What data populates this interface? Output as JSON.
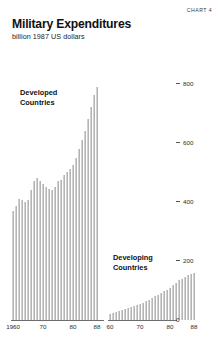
{
  "header": {
    "chart_label": "CHART 4",
    "title": "Military Expenditures",
    "subtitle": "billion 1987 US dollars"
  },
  "colors": {
    "bar": "#b4b4b4",
    "axis": "#6d6d6d",
    "text": "#111111"
  },
  "chart_data": {
    "type": "bar",
    "title": "Military Expenditures",
    "subtitle": "billion 1987 US dollars",
    "xlabel": "",
    "ylabel": "billion 1987 US dollars",
    "ylim": [
      0,
      880
    ],
    "grid": false,
    "legend_position": "inline-annotation",
    "y_ticks": [
      {
        "value": 800,
        "label": "800"
      },
      {
        "value": 600,
        "label": "600"
      },
      {
        "value": 400,
        "label": "400"
      },
      {
        "value": 200,
        "label": "200"
      },
      {
        "value": 0,
        "label": "0"
      }
    ],
    "panels": [
      {
        "name": "Developed Countries",
        "annotation_lines": [
          "Developed",
          "Countries"
        ],
        "x_tick_labels": [
          "1960",
          "70",
          "80",
          "88"
        ],
        "x_tick_years": [
          1960,
          1970,
          1980,
          1988
        ],
        "x": [
          1960,
          1961,
          1962,
          1963,
          1964,
          1965,
          1966,
          1967,
          1968,
          1969,
          1970,
          1971,
          1972,
          1973,
          1974,
          1975,
          1976,
          1977,
          1978,
          1979,
          1980,
          1981,
          1982,
          1983,
          1984,
          1985,
          1986,
          1987,
          1988
        ],
        "values": [
          370,
          385,
          410,
          405,
          400,
          405,
          440,
          470,
          480,
          470,
          460,
          450,
          445,
          440,
          450,
          470,
          475,
          490,
          500,
          510,
          525,
          550,
          580,
          610,
          640,
          680,
          720,
          760,
          790
        ]
      },
      {
        "name": "Developing Countries",
        "annotation_lines": [
          "Developing",
          "Countries"
        ],
        "x_tick_labels": [
          "60",
          "70",
          "80",
          "88"
        ],
        "x_tick_years": [
          1960,
          1970,
          1980,
          1988
        ],
        "x": [
          1960,
          1961,
          1962,
          1963,
          1964,
          1965,
          1966,
          1967,
          1968,
          1969,
          1970,
          1971,
          1972,
          1973,
          1974,
          1975,
          1976,
          1977,
          1978,
          1979,
          1980,
          1981,
          1982,
          1983,
          1984,
          1985,
          1986,
          1987,
          1988
        ],
        "values": [
          22,
          24,
          27,
          30,
          33,
          36,
          40,
          44,
          47,
          50,
          54,
          58,
          63,
          68,
          74,
          80,
          86,
          92,
          97,
          103,
          110,
          118,
          126,
          134,
          140,
          146,
          152,
          156,
          158
        ]
      }
    ]
  }
}
